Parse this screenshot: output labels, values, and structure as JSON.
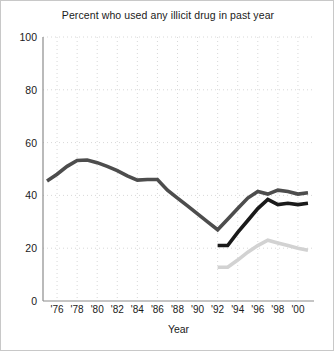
{
  "chart_data": {
    "type": "line",
    "title": "Percent who used any illicit drug in past year",
    "xlabel": "Year",
    "ylabel": "",
    "xlim": [
      1974.6,
      2001.6
    ],
    "ylim": [
      0,
      100
    ],
    "grid": true,
    "legend_position": "none",
    "x_tick_labels": [
      "'76",
      "'78",
      "'80",
      "'82",
      "'84",
      "'86",
      "'88",
      "'90",
      "'92",
      "'94",
      "'96",
      "'98",
      "'00"
    ],
    "x_tick_values": [
      1976,
      1978,
      1980,
      1982,
      1984,
      1986,
      1988,
      1990,
      1992,
      1994,
      1996,
      1998,
      2000
    ],
    "y_tick_labels": [
      "0",
      "20",
      "40",
      "60",
      "80",
      "100"
    ],
    "y_tick_values": [
      0,
      20,
      40,
      60,
      80,
      100
    ],
    "series": [
      {
        "name": "series-dark-gray",
        "color": "#4d4d4d",
        "width": 3.6,
        "x": [
          1975,
          1976,
          1977,
          1978,
          1979,
          1980,
          1981,
          1982,
          1983,
          1984,
          1985,
          1986,
          1987,
          1988,
          1989,
          1990,
          1991,
          1992,
          1993,
          1994,
          1995,
          1996,
          1997,
          1998,
          1999,
          2000,
          2001
        ],
        "values": [
          45.5,
          48.0,
          51.0,
          53.2,
          53.4,
          52.4,
          51.0,
          49.4,
          47.4,
          45.8,
          46.0,
          46.0,
          42.0,
          39.0,
          36.0,
          33.0,
          30.0,
          27.0,
          31.0,
          35.0,
          39.0,
          41.5,
          40.5,
          42.0,
          41.5,
          40.5,
          41.0
        ]
      },
      {
        "name": "series-black",
        "color": "#1a1a1a",
        "width": 3.6,
        "x": [
          1992,
          1993,
          1994,
          1995,
          1996,
          1997,
          1998,
          1999,
          2000,
          2001
        ],
        "values": [
          21.0,
          21.0,
          26.0,
          30.5,
          35.0,
          38.5,
          36.5,
          37.0,
          36.5,
          37.0
        ]
      },
      {
        "name": "series-light-gray",
        "color": "#d2d2d2",
        "width": 3.6,
        "x": [
          1992,
          1993,
          1994,
          1995,
          1996,
          1997,
          1998,
          1999,
          2000,
          2001
        ],
        "values": [
          12.8,
          12.8,
          15.5,
          18.5,
          21.0,
          23.0,
          22.0,
          21.0,
          20.0,
          19.2
        ]
      }
    ]
  },
  "style": {
    "grid_color": "#d8d8d8",
    "axis_color": "#8c8c8c",
    "background": "#ffffff",
    "border_color": "#c8c8c8",
    "text_color": "#1a1a1a"
  }
}
